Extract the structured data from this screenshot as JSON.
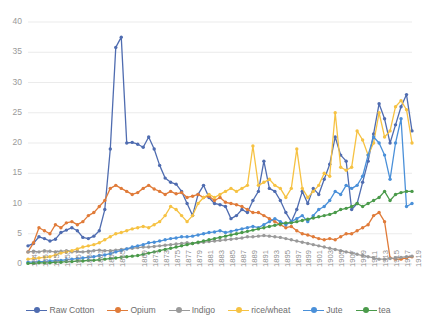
{
  "chart_data": {
    "type": "line",
    "title": "",
    "subtitle": "",
    "xlabel": "",
    "ylabel": "",
    "ylim": [
      0,
      40
    ],
    "xlim": [
      1849,
      1919
    ],
    "grid": true,
    "legend_position": "bottom",
    "y_ticks": [
      0,
      5,
      10,
      15,
      20,
      25,
      30,
      35,
      40
    ],
    "x_tick_labels": [
      "1849",
      "1851",
      "1853",
      "1855",
      "1857",
      "1859",
      "1861",
      "1863",
      "1865",
      "1869",
      "1871",
      "1873",
      "1875",
      "1877",
      "1879",
      "1881",
      "1883",
      "1885",
      "1887",
      "1889",
      "1891",
      "1893",
      "1895",
      "1897",
      "1899",
      "1901",
      "1903",
      "1905",
      "1907",
      "1909",
      "1911",
      "1913",
      "1915",
      "1917",
      "1919"
    ],
    "x": [
      1849,
      1850,
      1851,
      1852,
      1853,
      1854,
      1855,
      1856,
      1857,
      1858,
      1859,
      1860,
      1861,
      1862,
      1863,
      1864,
      1865,
      1866,
      1867,
      1868,
      1869,
      1870,
      1871,
      1872,
      1873,
      1874,
      1875,
      1876,
      1877,
      1878,
      1879,
      1880,
      1881,
      1882,
      1883,
      1884,
      1885,
      1886,
      1887,
      1888,
      1889,
      1890,
      1891,
      1892,
      1893,
      1894,
      1895,
      1896,
      1897,
      1898,
      1899,
      1900,
      1901,
      1902,
      1903,
      1904,
      1905,
      1906,
      1907,
      1908,
      1909,
      1910,
      1911,
      1912,
      1913,
      1914,
      1915,
      1916,
      1917,
      1918,
      1919
    ],
    "series": [
      {
        "name": "Raw Cotton",
        "color": "#4f6cb0",
        "values": [
          3.0,
          3.4,
          4.5,
          4.2,
          3.8,
          4.1,
          5.2,
          5.6,
          6.0,
          5.5,
          4.4,
          4.2,
          4.6,
          5.5,
          9.0,
          19.0,
          35.8,
          37.5,
          20.0,
          20.1,
          19.8,
          19.3,
          21.0,
          19.0,
          16.3,
          14.2,
          13.5,
          13.2,
          12.0,
          10.0,
          8.0,
          11.5,
          13.0,
          11.0,
          10.0,
          9.8,
          9.5,
          7.5,
          8.0,
          9.0,
          8.5,
          10.5,
          12.0,
          17.0,
          12.5,
          12.0,
          10.5,
          8.5,
          7.0,
          9.0,
          12.0,
          10.0,
          12.5,
          11.5,
          14.0,
          16.5,
          21.0,
          18.0,
          17.0,
          9.0,
          10.0,
          13.5,
          17.0,
          21.5,
          26.5,
          24.0,
          20.0,
          23.0,
          26.0,
          28.0,
          22.0
        ]
      },
      {
        "name": "Opium",
        "color": "#e07b39",
        "values": [
          2.0,
          3.5,
          6.0,
          5.5,
          5.0,
          6.5,
          6.0,
          6.8,
          7.0,
          6.5,
          7.0,
          8.0,
          8.5,
          9.5,
          10.5,
          12.5,
          13.0,
          12.5,
          12.0,
          11.5,
          11.8,
          12.5,
          13.0,
          12.4,
          12.0,
          11.5,
          12.0,
          11.6,
          11.8,
          11.0,
          11.2,
          11.5,
          11.0,
          11.2,
          10.5,
          11.0,
          10.2,
          10.0,
          9.8,
          9.5,
          9.0,
          8.5,
          8.5,
          8.0,
          7.5,
          7.0,
          6.5,
          6.0,
          6.2,
          5.5,
          5.0,
          4.8,
          4.5,
          4.2,
          4.0,
          4.2,
          4.0,
          4.5,
          5.0,
          5.0,
          5.5,
          6.0,
          6.5,
          8.0,
          8.5,
          7.0,
          1.0,
          0.8,
          0.8,
          1.0,
          1.2
        ]
      },
      {
        "name": "Indigo",
        "color": "#9a9a9a",
        "values": [
          2.0,
          2.1,
          2.0,
          2.2,
          2.1,
          2.0,
          2.1,
          2.2,
          2.0,
          2.1,
          2.0,
          2.1,
          2.2,
          2.3,
          2.2,
          2.2,
          2.3,
          2.4,
          2.5,
          2.6,
          2.7,
          2.8,
          2.8,
          2.9,
          3.0,
          3.1,
          3.2,
          3.3,
          3.4,
          3.5,
          3.4,
          3.5,
          3.6,
          3.7,
          3.8,
          3.9,
          4.0,
          4.1,
          4.2,
          4.3,
          4.5,
          4.5,
          4.6,
          4.7,
          4.6,
          4.5,
          4.4,
          4.2,
          4.0,
          3.8,
          3.6,
          3.4,
          3.2,
          3.0,
          2.8,
          2.6,
          2.4,
          2.2,
          2.0,
          1.8,
          1.6,
          1.4,
          1.2,
          1.0,
          0.8,
          0.8,
          0.9,
          1.0,
          1.1,
          1.2,
          1.3
        ]
      },
      {
        "name": "rice/wheat",
        "color": "#f6c243",
        "values": [
          0.8,
          0.9,
          1.0,
          1.1,
          1.2,
          1.5,
          1.8,
          2.0,
          2.2,
          2.5,
          2.8,
          3.0,
          3.2,
          3.5,
          4.0,
          4.5,
          5.0,
          5.2,
          5.5,
          5.8,
          6.0,
          6.2,
          6.0,
          6.5,
          7.0,
          8.0,
          9.5,
          9.0,
          8.0,
          7.0,
          8.0,
          10.0,
          11.0,
          11.5,
          11.0,
          11.5,
          12.0,
          12.5,
          12.0,
          12.5,
          13.0,
          19.5,
          13.0,
          13.5,
          14.0,
          13.0,
          12.5,
          11.0,
          12.5,
          19.0,
          12.5,
          11.0,
          12.0,
          13.0,
          15.0,
          14.5,
          25.0,
          16.0,
          15.5,
          16.0,
          22.0,
          20.5,
          18.0,
          20.0,
          25.0,
          21.0,
          22.0,
          26.0,
          27.0,
          25.5,
          20.0
        ]
      },
      {
        "name": "Jute",
        "color": "#4a90d9",
        "values": [
          0.3,
          0.3,
          0.4,
          0.4,
          0.5,
          0.5,
          0.6,
          0.7,
          0.8,
          0.9,
          1.0,
          1.1,
          1.2,
          1.4,
          1.5,
          1.7,
          2.0,
          2.2,
          2.5,
          2.8,
          3.0,
          3.2,
          3.5,
          3.6,
          3.8,
          4.0,
          4.2,
          4.3,
          4.5,
          4.5,
          4.6,
          4.8,
          5.0,
          5.2,
          5.3,
          5.5,
          5.2,
          5.4,
          5.6,
          5.8,
          6.0,
          6.2,
          6.0,
          6.5,
          7.0,
          7.5,
          7.0,
          6.5,
          7.0,
          7.5,
          8.0,
          7.0,
          8.0,
          9.0,
          9.5,
          10.5,
          12.0,
          11.5,
          13.0,
          12.5,
          13.0,
          14.5,
          18.0,
          21.0,
          20.0,
          18.0,
          14.0,
          20.0,
          24.0,
          9.5,
          10.0
        ]
      },
      {
        "name": "tea",
        "color": "#4a9a4a",
        "values": [
          0.1,
          0.1,
          0.2,
          0.2,
          0.2,
          0.3,
          0.3,
          0.4,
          0.4,
          0.5,
          0.5,
          0.6,
          0.6,
          0.7,
          0.8,
          0.9,
          1.0,
          1.1,
          1.2,
          1.3,
          1.4,
          1.6,
          1.8,
          2.0,
          2.2,
          2.4,
          2.6,
          2.8,
          3.0,
          3.2,
          3.4,
          3.6,
          3.8,
          4.0,
          4.2,
          4.4,
          4.6,
          4.8,
          5.0,
          5.2,
          5.4,
          5.6,
          5.8,
          6.0,
          6.2,
          6.4,
          6.6,
          6.8,
          6.8,
          7.0,
          7.2,
          7.4,
          7.6,
          7.8,
          8.0,
          8.2,
          8.5,
          9.0,
          9.2,
          9.5,
          10.0,
          9.5,
          10.0,
          10.5,
          11.0,
          12.0,
          10.5,
          11.5,
          11.8,
          12.0,
          12.0
        ]
      }
    ]
  },
  "legend": {
    "items": [
      {
        "label": "Raw Cotton",
        "color": "#4f6cb0"
      },
      {
        "label": "Opium",
        "color": "#e07b39"
      },
      {
        "label": "Indigo",
        "color": "#9a9a9a"
      },
      {
        "label": "rice/wheat",
        "color": "#f6c243"
      },
      {
        "label": "Jute",
        "color": "#4a90d9"
      },
      {
        "label": "tea",
        "color": "#4a9a4a"
      }
    ]
  }
}
